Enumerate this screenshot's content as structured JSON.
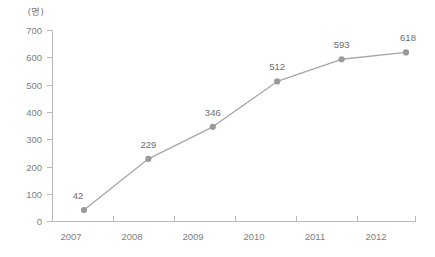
{
  "chart_data": {
    "type": "line",
    "title": "",
    "subtitle": "",
    "xlabel": "",
    "ylabel": "",
    "unit_label": "(명)",
    "categories": [
      "2007",
      "2008",
      "2009",
      "2010",
      "2011",
      "2012"
    ],
    "x": [
      2007,
      2008,
      2009,
      2010,
      2011,
      2012
    ],
    "values": [
      42,
      229,
      346,
      512,
      593,
      618
    ],
    "point_labels": [
      "42",
      "229",
      "346",
      "512",
      "593",
      "618"
    ],
    "series": [
      {
        "name": "",
        "values": [
          42,
          229,
          346,
          512,
          593,
          618
        ]
      }
    ],
    "ylim": [
      0,
      700
    ],
    "y_ticks": [
      0,
      100,
      200,
      300,
      400,
      500,
      600,
      700
    ],
    "y_tick_labels": [
      "0",
      "100",
      "200",
      "300",
      "400",
      "500",
      "600",
      "700"
    ],
    "x_tick_labels": [
      "2007",
      "2008",
      "2009",
      "2010",
      "2011",
      "2012"
    ],
    "grid": false,
    "legend": false,
    "legend_position": "none",
    "colors": {
      "line": "#a6a6a6",
      "marker": "#9a9a9a",
      "axis": "#b9b9b9",
      "tick_text": "#808080",
      "label_text": "#6e6e6e",
      "background": "#ffffff"
    }
  }
}
